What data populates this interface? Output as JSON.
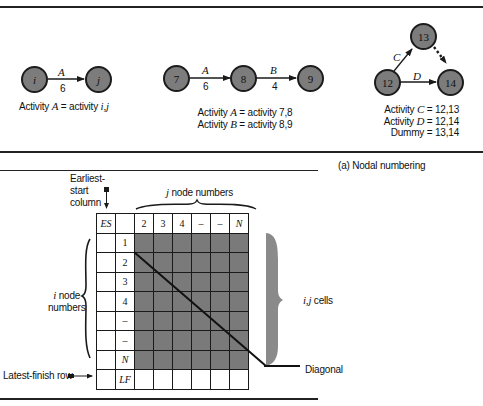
{
  "panel_a": {
    "diagram1": {
      "nodes": [
        "i",
        "j"
      ],
      "arrow": {
        "label": "A",
        "duration": "6"
      },
      "caption_prefix": "Activity",
      "caption_var": "A",
      "caption_eq": "= activity",
      "caption_val": "i,j"
    },
    "diagram2": {
      "nodes": [
        "7",
        "8",
        "9"
      ],
      "arrows": [
        {
          "label": "A",
          "duration": "6"
        },
        {
          "label": "B",
          "duration": "4"
        }
      ],
      "caption_lines": [
        {
          "prefix": "Activity",
          "var": "A",
          "rest": "= activity 7,8"
        },
        {
          "prefix": "Activity",
          "var": "B",
          "rest": "= activity 8,9"
        }
      ]
    },
    "diagram3": {
      "nodes": [
        "12",
        "13",
        "14"
      ],
      "arrows": [
        {
          "label": "C",
          "from": "12",
          "to": "13"
        },
        {
          "label": "D",
          "from": "12",
          "to": "14"
        },
        {
          "label": "",
          "from": "13",
          "to": "14",
          "style": "dummy-dotted"
        }
      ],
      "caption_lines": [
        {
          "prefix": "Activity",
          "var": "C",
          "rest": "= 12,13"
        },
        {
          "prefix": "Activity",
          "var": "D",
          "rest": "= 12,14"
        },
        {
          "prefix": "Dummy",
          "var": "",
          "rest": "= 13,14"
        }
      ]
    },
    "caption": "(a) Nodal numbering"
  },
  "panel_b": {
    "labels": {
      "earliest_start": [
        "Earliest-",
        "start",
        "column"
      ],
      "j_nodes": "j node numbers",
      "i_nodes": [
        "i node",
        "numbers"
      ],
      "ij_cells": "i,j cells",
      "diagonal": "Diagonal",
      "latest_finish": "Latest-finish row"
    },
    "grid": {
      "header": [
        "ES",
        "",
        "2",
        "3",
        "4",
        "–",
        "–",
        "N"
      ],
      "row_labels": [
        "1",
        "2",
        "3",
        "4",
        "–",
        "–",
        "N",
        "LF"
      ]
    }
  },
  "colors": {
    "node_fill": "#7c7c7c",
    "shaded_cell": "#7a7a7a",
    "brace_fill": "#8a8a8a",
    "line": "#1a1a1a"
  }
}
